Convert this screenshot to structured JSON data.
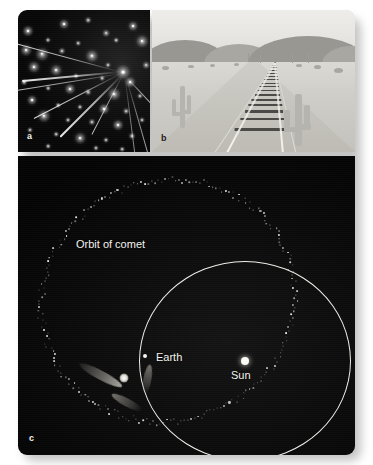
{
  "figure": {
    "background_color": "#ffffff",
    "panels": [
      {
        "id": "a",
        "label": "a",
        "kind": "photograph",
        "subject": "meteor shower radiant among stars",
        "background_color": "#0a0a0a"
      },
      {
        "id": "b",
        "label": "b",
        "kind": "photograph",
        "subject": "desert railroad tracks converging at vanishing point",
        "background_color": "#d7d6d2"
      },
      {
        "id": "c",
        "label": "c",
        "kind": "diagram",
        "subject": "comet orbit crossing Earth orbit around the Sun",
        "background_color": "#060606"
      }
    ]
  },
  "panel_a": {
    "label": "a",
    "radiant": {
      "x": 105,
      "y": 62
    },
    "stars": [
      {
        "x": 10,
        "y": 21,
        "r": 2.2
      },
      {
        "x": 46,
        "y": 14,
        "r": 2.0
      },
      {
        "x": 70,
        "y": 10,
        "r": 1.3
      },
      {
        "x": 88,
        "y": 23,
        "r": 1.5
      },
      {
        "x": 115,
        "y": 16,
        "r": 2.0
      },
      {
        "x": 30,
        "y": 30,
        "r": 1.2
      },
      {
        "x": 60,
        "y": 33,
        "r": 1.1
      },
      {
        "x": 98,
        "y": 30,
        "r": 1.1
      },
      {
        "x": 124,
        "y": 31,
        "r": 2.5
      },
      {
        "x": 8,
        "y": 40,
        "r": 2.3
      },
      {
        "x": 24,
        "y": 44,
        "r": 2.7
      },
      {
        "x": 44,
        "y": 41,
        "r": 1.4
      },
      {
        "x": 74,
        "y": 46,
        "r": 2.6
      },
      {
        "x": 105,
        "y": 62,
        "r": 3.0
      },
      {
        "x": 90,
        "y": 55,
        "r": 1.2
      },
      {
        "x": 128,
        "y": 55,
        "r": 1.5
      },
      {
        "x": 16,
        "y": 57,
        "r": 2.4
      },
      {
        "x": 38,
        "y": 60,
        "r": 2.3
      },
      {
        "x": 58,
        "y": 66,
        "r": 1.2
      },
      {
        "x": 84,
        "y": 68,
        "r": 1.1
      },
      {
        "x": 112,
        "y": 72,
        "r": 2.1
      },
      {
        "x": 6,
        "y": 72,
        "r": 1.3
      },
      {
        "x": 30,
        "y": 78,
        "r": 1.1
      },
      {
        "x": 52,
        "y": 79,
        "r": 2.2
      },
      {
        "x": 70,
        "y": 82,
        "r": 1.3
      },
      {
        "x": 96,
        "y": 84,
        "r": 2.5
      },
      {
        "x": 122,
        "y": 86,
        "r": 1.2
      },
      {
        "x": 14,
        "y": 90,
        "r": 2.0
      },
      {
        "x": 40,
        "y": 95,
        "r": 1.1
      },
      {
        "x": 62,
        "y": 97,
        "r": 1.2
      },
      {
        "x": 86,
        "y": 99,
        "r": 2.2
      },
      {
        "x": 108,
        "y": 101,
        "r": 1.3
      },
      {
        "x": 26,
        "y": 106,
        "r": 2.6
      },
      {
        "x": 50,
        "y": 110,
        "r": 1.2
      },
      {
        "x": 74,
        "y": 112,
        "r": 1.4
      },
      {
        "x": 100,
        "y": 115,
        "r": 2.2
      },
      {
        "x": 124,
        "y": 110,
        "r": 1.2
      },
      {
        "x": 12,
        "y": 120,
        "r": 1.2
      },
      {
        "x": 38,
        "y": 124,
        "r": 1.1
      },
      {
        "x": 62,
        "y": 128,
        "r": 2.3
      },
      {
        "x": 88,
        "y": 130,
        "r": 1.2
      },
      {
        "x": 114,
        "y": 126,
        "r": 1.4
      },
      {
        "x": 30,
        "y": 136,
        "r": 1.1
      },
      {
        "x": 78,
        "y": 138,
        "r": 1.2
      },
      {
        "x": 104,
        "y": 139,
        "r": 1.1
      }
    ],
    "trails": [
      {
        "x1": -14,
        "y1": 30,
        "x2": 104,
        "y2": 62,
        "w": 1.3,
        "o": 0.92
      },
      {
        "x1": -14,
        "y1": 82,
        "x2": 104,
        "y2": 63,
        "w": 1.2,
        "o": 0.8
      },
      {
        "x1": 4,
        "y1": 70,
        "x2": 102,
        "y2": 61,
        "w": 1.5,
        "o": 0.95
      },
      {
        "x1": 16,
        "y1": 108,
        "x2": 103,
        "y2": 63,
        "w": 1.4,
        "o": 0.9
      },
      {
        "x1": 42,
        "y1": 126,
        "x2": 104,
        "y2": 64,
        "w": 1.5,
        "o": 0.95
      },
      {
        "x1": 74,
        "y1": 124,
        "x2": 105,
        "y2": 64,
        "w": 1.3,
        "o": 0.85
      },
      {
        "x1": 136,
        "y1": 96,
        "x2": 108,
        "y2": 66,
        "w": 1.2,
        "o": 0.75
      },
      {
        "x1": 132,
        "y1": 150,
        "x2": 108,
        "y2": 66,
        "w": 1.2,
        "o": 0.7
      },
      {
        "x1": 118,
        "y1": 152,
        "x2": 107,
        "y2": 66,
        "w": 1.1,
        "o": 0.6
      }
    ]
  },
  "panel_b": {
    "label": "b",
    "horizon_y": 52,
    "vanishing_point": {
      "x": 123,
      "y": 52
    },
    "hills": [
      {
        "x": -10,
        "y": 30,
        "w": 86,
        "h": 24
      },
      {
        "x": 52,
        "y": 34,
        "w": 70,
        "h": 20
      },
      {
        "x": 96,
        "y": 26,
        "w": 120,
        "h": 28
      },
      {
        "x": 170,
        "y": 36,
        "w": 60,
        "h": 18
      }
    ],
    "cacti": [
      {
        "x": 20,
        "y": 76,
        "h": 42,
        "w": 5
      },
      {
        "x": 132,
        "y": 84,
        "h": 52,
        "w": 7
      }
    ],
    "bushes": [
      {
        "x": 10,
        "y": 56,
        "w": 7,
        "h": 4
      },
      {
        "x": 36,
        "y": 55,
        "w": 6,
        "h": 3
      },
      {
        "x": 58,
        "y": 54,
        "w": 5,
        "h": 3
      },
      {
        "x": 82,
        "y": 53,
        "w": 5,
        "h": 3
      },
      {
        "x": 144,
        "y": 54,
        "w": 6,
        "h": 3
      },
      {
        "x": 162,
        "y": 55,
        "w": 7,
        "h": 4
      },
      {
        "x": 182,
        "y": 58,
        "w": 9,
        "h": 5
      }
    ],
    "poles": [
      {
        "x": 96,
        "y": 43,
        "h": 10
      },
      {
        "x": 108,
        "y": 45,
        "h": 8
      },
      {
        "x": 140,
        "y": 44,
        "h": 9
      },
      {
        "x": 156,
        "y": 43,
        "h": 10
      }
    ],
    "tie_count": 17
  },
  "panel_c": {
    "label": "c",
    "labels": {
      "comet_orbit": "Orbit of comet",
      "earth": "Earth",
      "sun": "Sun"
    },
    "sun": {
      "x": 227,
      "y": 205
    },
    "earth": {
      "x": 127,
      "y": 200
    },
    "earth_orbit": {
      "cx": 227,
      "cy": 205,
      "rx": 106,
      "ry": 100
    },
    "comet_orbit": {
      "cx": 150,
      "cy": 145,
      "rx": 128,
      "ry": 120,
      "rotation_deg": -22
    },
    "comet": {
      "x": 106,
      "y": 222,
      "size": 9
    },
    "label_positions": {
      "comet_orbit": {
        "x": 58,
        "y": 83
      },
      "earth": {
        "x": 138,
        "y": 196
      },
      "sun": {
        "x": 213,
        "y": 214
      }
    },
    "dust_particle_count": 230
  }
}
